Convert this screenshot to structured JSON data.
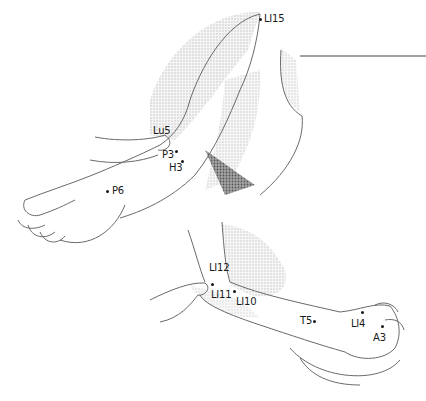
{
  "figure": {
    "title": "",
    "colors": {
      "line": "#6a6a6a",
      "shade": "#c8c8c8",
      "dark_shade": "#555555",
      "label": "#1a1a1a",
      "rule": "#444444"
    }
  },
  "upper_arm": {
    "points": [
      {
        "id": "LI15",
        "label": "LI15",
        "x": 261,
        "y": 19,
        "lx": 265,
        "ly": 14
      },
      {
        "id": "Lu5",
        "label": "Lu5",
        "x": 169,
        "y": 145,
        "lx": 154,
        "ly": 127
      },
      {
        "id": "P3",
        "label": "P3",
        "x": 175,
        "y": 152,
        "lx": 163,
        "ly": 151
      },
      {
        "id": "H3",
        "label": "H3",
        "x": 181,
        "y": 162,
        "lx": 170,
        "ly": 163
      },
      {
        "id": "P6",
        "label": "P6",
        "x": 107,
        "y": 191,
        "lx": 112,
        "ly": 186
      }
    ]
  },
  "lower_arm": {
    "points": [
      {
        "id": "LI12",
        "label": "LI12",
        "x": 211,
        "y": 284,
        "lx": 209,
        "ly": 263
      },
      {
        "id": "LI11",
        "label": "LI11",
        "x": 233,
        "y": 291,
        "lx": 211,
        "ly": 289
      },
      {
        "id": "LI10",
        "label": "LI10",
        "x": 233,
        "y": 291,
        "lx": 235,
        "ly": 297
      },
      {
        "id": "T5",
        "label": "T5",
        "x": 313,
        "y": 321,
        "lx": 300,
        "ly": 316
      },
      {
        "id": "LI4",
        "label": "LI4",
        "x": 361,
        "y": 313,
        "lx": 351,
        "ly": 319
      },
      {
        "id": "A3",
        "label": "A3",
        "x": 381,
        "y": 326,
        "lx": 373,
        "ly": 333
      }
    ]
  }
}
